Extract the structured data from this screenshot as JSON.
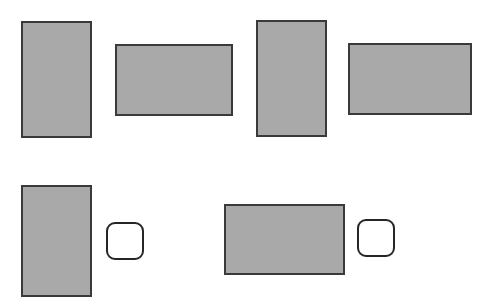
{
  "canvas": {
    "width": 483,
    "height": 302,
    "background_color": "#ffffff",
    "title": "Shape Layout Diagram"
  },
  "style_tokens": {
    "rect_fill": "#a9a9a9",
    "rect_stroke": "#3a3a3a",
    "rect_stroke_width": 2,
    "rounded_fill": "#ffffff",
    "rounded_stroke": "#262626",
    "rounded_stroke_width": 2,
    "rounded_corner_radius": 9
  },
  "rows": [
    {
      "name": "top-row",
      "shapes": [
        {
          "id": "rect-1",
          "name": "portrait-rectangle-1",
          "kind": "rect",
          "orientation": "portrait",
          "x": 21,
          "y": 21,
          "width": 71,
          "height": 117,
          "fill": "#a9a9a9",
          "stroke": "#3a3a3a"
        },
        {
          "id": "rect-2",
          "name": "landscape-rectangle-1",
          "kind": "rect",
          "orientation": "landscape",
          "x": 115,
          "y": 44,
          "width": 118,
          "height": 72,
          "fill": "#a9a9a9",
          "stroke": "#3a3a3a"
        },
        {
          "id": "rect-3",
          "name": "portrait-rectangle-2",
          "kind": "rect",
          "orientation": "portrait",
          "x": 256,
          "y": 20,
          "width": 71,
          "height": 117,
          "fill": "#a9a9a9",
          "stroke": "#3a3a3a"
        },
        {
          "id": "rect-4",
          "name": "landscape-rectangle-2",
          "kind": "rect",
          "orientation": "landscape",
          "x": 348,
          "y": 43,
          "width": 124,
          "height": 72,
          "fill": "#a9a9a9",
          "stroke": "#3a3a3a"
        }
      ]
    },
    {
      "name": "bottom-row",
      "shapes": [
        {
          "id": "rect-5",
          "name": "portrait-rectangle-3",
          "kind": "rect",
          "orientation": "portrait",
          "x": 21,
          "y": 185,
          "width": 71,
          "height": 112,
          "fill": "#a9a9a9",
          "stroke": "#3a3a3a"
        },
        {
          "id": "round-1",
          "name": "rounded-square-1",
          "kind": "rounded",
          "orientation": "square",
          "x": 106,
          "y": 222,
          "width": 38,
          "height": 38,
          "fill": "#ffffff",
          "stroke": "#262626"
        },
        {
          "id": "rect-6",
          "name": "landscape-rectangle-3",
          "kind": "rect",
          "orientation": "landscape",
          "x": 224,
          "y": 204,
          "width": 121,
          "height": 71,
          "fill": "#a9a9a9",
          "stroke": "#3a3a3a"
        },
        {
          "id": "round-2",
          "name": "rounded-square-2",
          "kind": "rounded",
          "orientation": "square",
          "x": 357,
          "y": 219,
          "width": 38,
          "height": 38,
          "fill": "#ffffff",
          "stroke": "#262626"
        }
      ]
    }
  ]
}
